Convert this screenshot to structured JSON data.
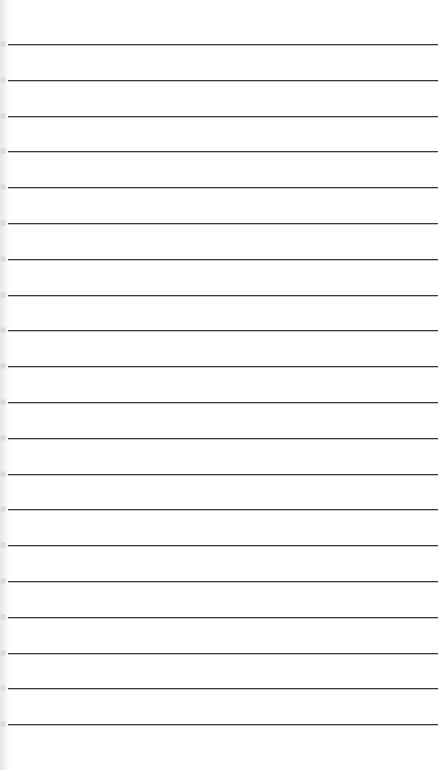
{
  "page": {
    "type": "lined-paper",
    "background": "#ffffff",
    "line_color": "#3a3a3a",
    "line_count": 20,
    "first_line_y": 44,
    "line_spacing": 35.8,
    "lines": []
  }
}
